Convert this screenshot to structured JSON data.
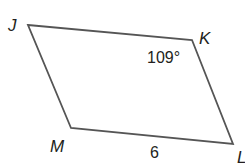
{
  "figure": {
    "type": "parallelogram",
    "vertices": [
      {
        "name": "J",
        "x": 28,
        "y": 25
      },
      {
        "name": "K",
        "x": 192,
        "y": 40
      },
      {
        "name": "L",
        "x": 233,
        "y": 144
      },
      {
        "name": "M",
        "x": 71,
        "y": 128
      }
    ],
    "labels": {
      "J": "J",
      "K": "K",
      "L": "L",
      "M": "M"
    },
    "angle_K": "109°",
    "side_ML": "6",
    "stroke_color": "#555555"
  }
}
